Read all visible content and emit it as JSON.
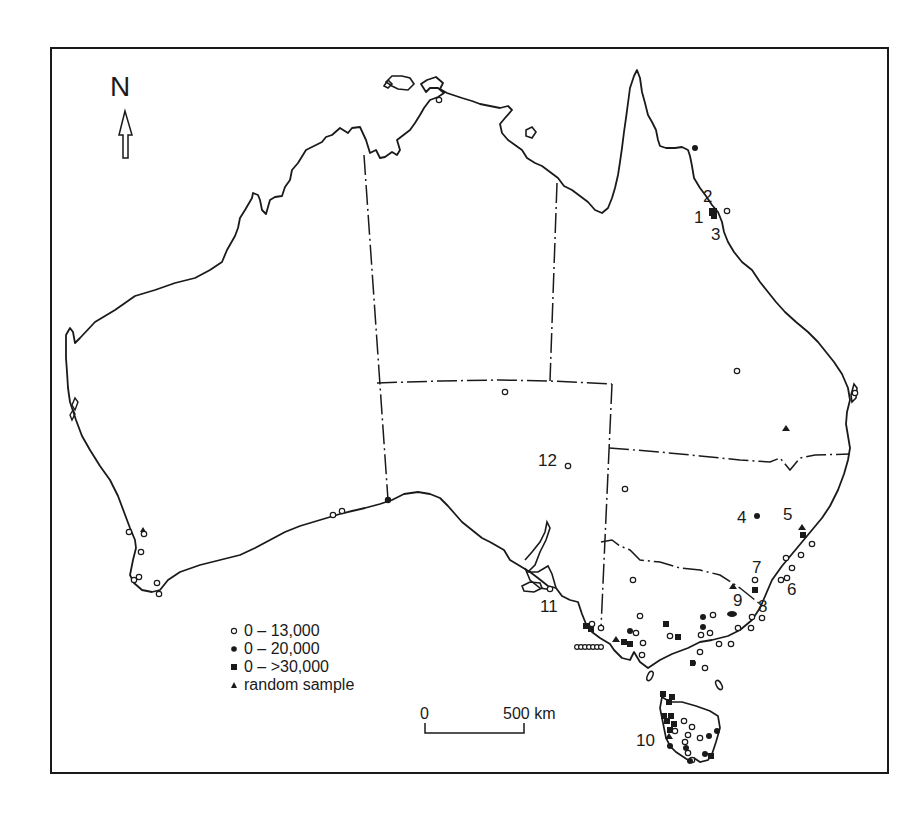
{
  "map": {
    "north_label": "N",
    "north_icon": "north-arrow-icon",
    "colors": {
      "ink": "#1a1a1a",
      "background": "#ffffff"
    }
  },
  "legend": {
    "items": [
      {
        "symbol": "open-circle",
        "label": "0 – 13,000"
      },
      {
        "symbol": "filled-circle",
        "label": "0 – 20,000"
      },
      {
        "symbol": "filled-square",
        "label": "0 – >30,000"
      },
      {
        "symbol": "filled-triangle",
        "label": "random sample"
      }
    ]
  },
  "scale_bar": {
    "start_label": "0",
    "end_label": "500 km"
  },
  "site_labels": [
    {
      "id": "1",
      "text": "1",
      "x": 694,
      "y": 209
    },
    {
      "id": "2",
      "text": "2",
      "x": 703,
      "y": 187
    },
    {
      "id": "3",
      "text": "3",
      "x": 711,
      "y": 226
    },
    {
      "id": "4",
      "text": "4",
      "x": 737,
      "y": 508
    },
    {
      "id": "5",
      "text": "5",
      "x": 783,
      "y": 505
    },
    {
      "id": "6",
      "text": "6",
      "x": 787,
      "y": 580
    },
    {
      "id": "7",
      "text": "7",
      "x": 752,
      "y": 558
    },
    {
      "id": "8",
      "text": "8",
      "x": 758,
      "y": 597
    },
    {
      "id": "9",
      "text": "9",
      "x": 733,
      "y": 591
    },
    {
      "id": "10",
      "text": "10",
      "x": 636,
      "y": 732
    },
    {
      "id": "11",
      "text": "11",
      "x": 540,
      "y": 597
    },
    {
      "id": "12",
      "text": "12",
      "x": 538,
      "y": 451
    }
  ]
}
